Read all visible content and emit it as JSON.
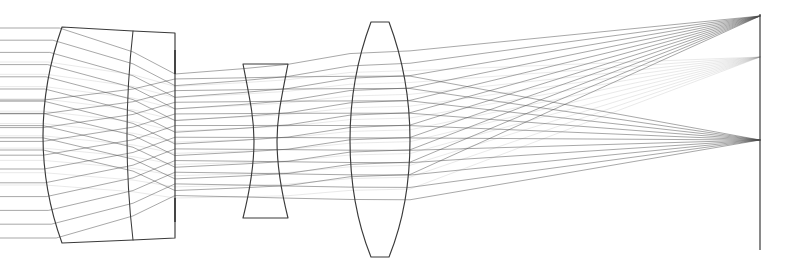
{
  "figure": {
    "background_color": "#ffffff",
    "line_color": "#3a3a3a",
    "ray_color": "#555555",
    "width": 795,
    "height": 273
  },
  "chart_data": {
    "type": "line",
    "xlabel": "",
    "ylabel": "",
    "grid": false,
    "legend_position": "none",
    "xlim": [
      0,
      795
    ],
    "ylim": [
      0,
      273
    ],
    "axis_orientation": "optical-axis-horizontal",
    "optical_axis_y": 136,
    "elements": [
      {
        "name": "front-cemented-doublet",
        "type": "doublet",
        "index": 1,
        "shape": "positive-meniscus-cemented",
        "front_vertex_x": 43,
        "front_edge_x": 62,
        "cement_surface_x": 133,
        "rear_surface_x": 175,
        "semi_height_top_y": 27,
        "semi_height_bottom_y": 243,
        "front_curvature": "convex",
        "cement_curvature": "slightly-convex"
      },
      {
        "name": "aperture-stop",
        "type": "stop",
        "index": 2,
        "x": 175,
        "upper_tick_y1": 50,
        "upper_tick_y2": 74,
        "lower_tick_y1": 198,
        "lower_tick_y2": 222,
        "clear_aperture_top_y": 74,
        "clear_aperture_bottom_y": 198
      },
      {
        "name": "negative-biconcave-element",
        "type": "singlet",
        "index": 3,
        "shape": "biconcave",
        "front_surface_x": 243,
        "rear_surface_x": 288,
        "center_thickness_x1": 256,
        "center_thickness_x2": 277,
        "top_y": 64,
        "bottom_y": 218
      },
      {
        "name": "positive-biconvex-element",
        "type": "singlet",
        "index": 4,
        "shape": "biconvex",
        "front_vertex_x": 350,
        "rear_vertex_x": 410,
        "center_x": 380,
        "top_y": 22,
        "bottom_y": 257,
        "edge_thickness": "thin"
      },
      {
        "name": "image-plane",
        "type": "plane",
        "index": 5,
        "x": 760,
        "top_y": 14,
        "bottom_y": 250
      }
    ],
    "series": [
      {
        "name": "field-bundle-upper",
        "field_angle_label": "upper field",
        "focus_x": 760,
        "focus_y": 16,
        "ray_count": 11,
        "color": "#4a4a4a"
      },
      {
        "name": "field-bundle-middle",
        "field_angle_label": "intermediate field",
        "focus_x": 760,
        "focus_y": 57,
        "ray_count": 11,
        "color": "#8a8a8a"
      },
      {
        "name": "field-bundle-axial",
        "field_angle_label": "axial / lower field",
        "focus_x": 760,
        "focus_y": 140,
        "ray_count": 11,
        "color": "#4a4a4a"
      }
    ],
    "notes": [
      "Three ray bundles enter from the left as parallel pencils at three different field angles.",
      "Bundles are refracted by the front doublet, limited by the aperture stop, diverged by the negative element, and converged by the rear positive element.",
      "Each bundle converges to a distinct height on the flat image plane at the right."
    ]
  }
}
